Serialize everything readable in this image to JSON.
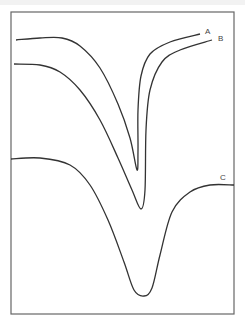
{
  "chart_data": {
    "type": "line",
    "title": "",
    "xlabel": "",
    "ylabel": "",
    "grid": false,
    "legend": "inline labels at curve ends",
    "series": [
      {
        "name": "A",
        "description": "sharp narrow absorption dip, highest baseline",
        "points": [
          [
            16,
            40
          ],
          [
            40,
            38
          ],
          [
            62,
            38
          ],
          [
            80,
            46
          ],
          [
            100,
            68
          ],
          [
            118,
            104
          ],
          [
            130,
            138
          ],
          [
            137,
            170
          ],
          [
            138,
            150
          ],
          [
            138,
            110
          ],
          [
            141,
            76
          ],
          [
            150,
            54
          ],
          [
            170,
            42
          ],
          [
            200,
            34
          ]
        ]
      },
      {
        "name": "B",
        "description": "narrow dip, slightly deeper and broader than A",
        "points": [
          [
            14,
            64
          ],
          [
            40,
            65
          ],
          [
            60,
            72
          ],
          [
            80,
            90
          ],
          [
            100,
            120
          ],
          [
            118,
            158
          ],
          [
            132,
            190
          ],
          [
            141,
            209
          ],
          [
            145,
            190
          ],
          [
            146,
            130
          ],
          [
            150,
            90
          ],
          [
            162,
            62
          ],
          [
            180,
            50
          ],
          [
            212,
            40
          ]
        ]
      },
      {
        "name": "C",
        "description": "broad deep dip, lowest baseline",
        "points": [
          [
            11,
            159
          ],
          [
            40,
            158
          ],
          [
            70,
            165
          ],
          [
            90,
            185
          ],
          [
            108,
            220
          ],
          [
            124,
            262
          ],
          [
            134,
            290
          ],
          [
            144,
            296
          ],
          [
            152,
            288
          ],
          [
            160,
            255
          ],
          [
            172,
            212
          ],
          [
            190,
            192
          ],
          [
            210,
            185
          ],
          [
            234,
            185
          ]
        ]
      }
    ],
    "labels": [
      {
        "text": "A",
        "x": 205,
        "y": 34
      },
      {
        "text": "B",
        "x": 218,
        "y": 41
      },
      {
        "text": "C",
        "x": 220,
        "y": 180
      }
    ],
    "frame": {
      "x": 11,
      "y": 12,
      "width": 223,
      "height": 302
    },
    "line_color": "#333333",
    "frame_color": "#666666"
  }
}
